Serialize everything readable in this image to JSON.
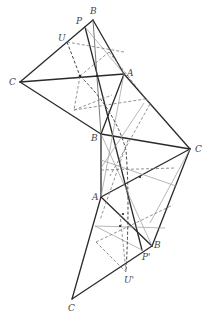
{
  "diagram": {
    "title": "",
    "labels": {
      "C1": "C",
      "B1": "B",
      "P": "P",
      "U": "U",
      "A1": "A",
      "B2": "B",
      "C2": "C",
      "A2": "A",
      "B3": "B",
      "P2": "P'",
      "U2": "U'",
      "C3": "C"
    },
    "vertices": {
      "C1": [
        20,
        82
      ],
      "B1": [
        93,
        20
      ],
      "P": [
        85,
        27
      ],
      "U": [
        67,
        42
      ],
      "A1": [
        124,
        74
      ],
      "B2": [
        101,
        134
      ],
      "C2": [
        190,
        149
      ],
      "A2": [
        101,
        197
      ],
      "B3": [
        152,
        246
      ],
      "P2": [
        142,
        250
      ],
      "U2": [
        126,
        272
      ],
      "C3": [
        72,
        299
      ]
    },
    "colors": {
      "solid": "#2a2a2a",
      "thin": "#555555",
      "dashed": "#777777"
    }
  }
}
